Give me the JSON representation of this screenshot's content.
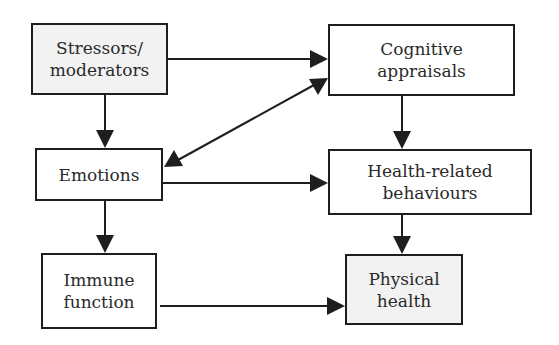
{
  "diagram": {
    "type": "flow-diagram",
    "nodes": [
      {
        "id": "stressors",
        "lines": [
          "Stressors/",
          "moderators"
        ],
        "shaded": true
      },
      {
        "id": "cognitive",
        "lines": [
          "Cognitive",
          "appraisals"
        ],
        "shaded": false
      },
      {
        "id": "emotions",
        "lines": [
          "Emotions"
        ],
        "shaded": false
      },
      {
        "id": "behaviours",
        "lines": [
          "Health-related",
          "behaviours"
        ],
        "shaded": false
      },
      {
        "id": "immune",
        "lines": [
          "Immune",
          "function"
        ],
        "shaded": false
      },
      {
        "id": "physical",
        "lines": [
          "Physical",
          "health"
        ],
        "shaded": true
      }
    ],
    "edges": [
      {
        "from": "stressors",
        "to": "cognitive",
        "direction": "forward"
      },
      {
        "from": "stressors",
        "to": "emotions",
        "direction": "forward"
      },
      {
        "from": "emotions",
        "to": "cognitive",
        "direction": "bidirectional"
      },
      {
        "from": "cognitive",
        "to": "behaviours",
        "direction": "forward"
      },
      {
        "from": "emotions",
        "to": "behaviours",
        "direction": "forward"
      },
      {
        "from": "emotions",
        "to": "immune",
        "direction": "forward"
      },
      {
        "from": "behaviours",
        "to": "physical",
        "direction": "forward"
      },
      {
        "from": "immune",
        "to": "physical",
        "direction": "forward"
      }
    ],
    "colors": {
      "stroke": "#1e1e1e",
      "shaded_fill": "#f2f2f2",
      "fill": "#ffffff",
      "text": "#2a2a2a"
    }
  }
}
